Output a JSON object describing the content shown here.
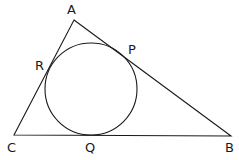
{
  "diagram": {
    "vertices": [
      {
        "id": "A",
        "label": "A",
        "x": 74,
        "y": 20
      },
      {
        "id": "B",
        "label": "B",
        "x": 231,
        "y": 136
      },
      {
        "id": "C",
        "label": "C",
        "x": 14,
        "y": 135
      }
    ],
    "tangent_points": [
      {
        "id": "P",
        "label": "P",
        "side": "AB"
      },
      {
        "id": "Q",
        "label": "Q",
        "side": "BC"
      },
      {
        "id": "R",
        "label": "R",
        "side": "AC"
      }
    ],
    "incircle": {
      "cx": 91,
      "cy": 89,
      "r": 46
    },
    "labels": {
      "A": "A",
      "B": "B",
      "C": "C",
      "P": "P",
      "Q": "Q",
      "R": "R"
    },
    "colors": {
      "stroke": "#1a1a1a",
      "background": "#ffffff"
    }
  }
}
